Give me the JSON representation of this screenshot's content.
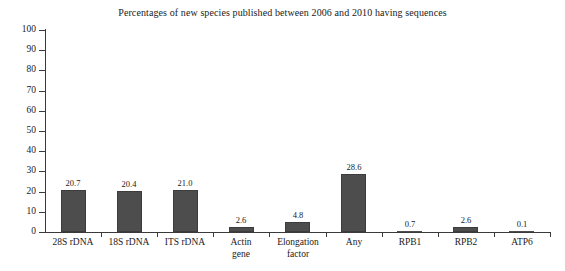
{
  "chart_data": {
    "type": "bar",
    "title": "Percentages of new species published between 2006 and 2010 having sequences",
    "xlabel": "",
    "ylabel": "",
    "ylim": [
      0,
      100
    ],
    "yticks": [
      0,
      10,
      20,
      30,
      40,
      50,
      60,
      70,
      80,
      90,
      100
    ],
    "ytick_labels": [
      "0",
      "10",
      "20",
      "30",
      "40",
      "50",
      "60",
      "70",
      "80",
      "90",
      "100"
    ],
    "grid": false,
    "legend": "none",
    "bar_color": "#4d4d4d",
    "axis_color": "#3a3a3a",
    "background": "#ffffff",
    "categories": [
      "28S rDNA",
      "18S rDNA",
      "ITS rDNA",
      "Actin gene",
      "Elongation factor",
      "Any",
      "RPB1",
      "RPB2",
      "ATP6"
    ],
    "category_lines": [
      [
        "28S rDNA"
      ],
      [
        "18S rDNA"
      ],
      [
        "ITS rDNA"
      ],
      [
        "Actin",
        "gene"
      ],
      [
        "Elongation",
        "factor"
      ],
      [
        "Any"
      ],
      [
        "RPB1"
      ],
      [
        "RPB2"
      ],
      [
        "ATP6"
      ]
    ],
    "values": [
      20.7,
      20.4,
      21.0,
      2.6,
      4.8,
      28.6,
      0.7,
      2.6,
      0.1
    ],
    "value_labels": [
      "20.7",
      "20.4",
      "21.0",
      "2.6",
      "4.8",
      "28.6",
      "0.7",
      "2.6",
      "0.1"
    ]
  }
}
